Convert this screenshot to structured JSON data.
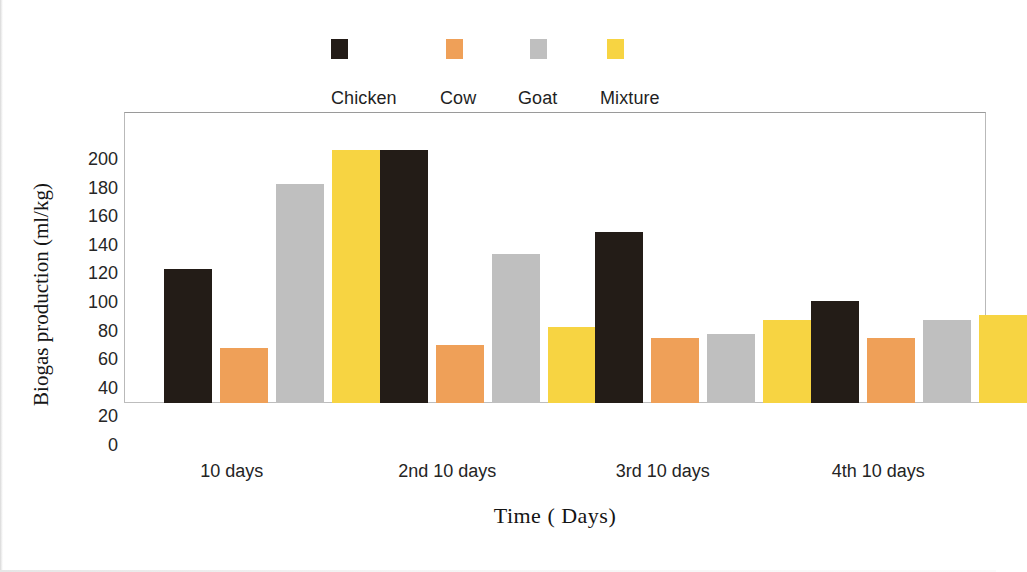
{
  "chart_data": {
    "type": "bar",
    "title": "",
    "xlabel": "Time ( Days)",
    "ylabel": "Biogas production (ml/kg)",
    "categories": [
      "10 days",
      "2nd 10 days",
      "3rd 10 days",
      "4th 10 days"
    ],
    "series": [
      {
        "name": "Chicken",
        "color": "#231c17",
        "values": [
          110,
          208,
          140,
          84
        ]
      },
      {
        "name": "Cow",
        "color": "#efa058",
        "values": [
          45,
          48,
          53,
          53
        ]
      },
      {
        "name": "Goat",
        "color": "#bfbfbf",
        "values": [
          180,
          122,
          57,
          68
        ]
      },
      {
        "name": "Mixture",
        "color": "#f7d442",
        "values": [
          208,
          62,
          68,
          72
        ]
      }
    ],
    "ylim": [
      0,
      200
    ],
    "yticks": [
      200,
      180,
      160,
      140,
      120,
      100,
      80,
      60,
      40,
      20,
      0
    ],
    "ytick_labels": [
      "200",
      "180",
      "160",
      "140",
      "120",
      "100",
      "80",
      "60",
      "40",
      "20",
      "0"
    ],
    "grid": false,
    "legend_position": "top"
  },
  "legend": {
    "entries": [
      {
        "label": "Chicken",
        "color": "#231c17"
      },
      {
        "label": "Cow",
        "color": "#efa058"
      },
      {
        "label": "Goat",
        "color": "#bfbfbf"
      },
      {
        "label": "Mixture",
        "color": "#f7d442"
      }
    ]
  },
  "axes": {
    "y_title": "Biogas production (ml/kg)",
    "x_title": "Time ( Days)"
  }
}
